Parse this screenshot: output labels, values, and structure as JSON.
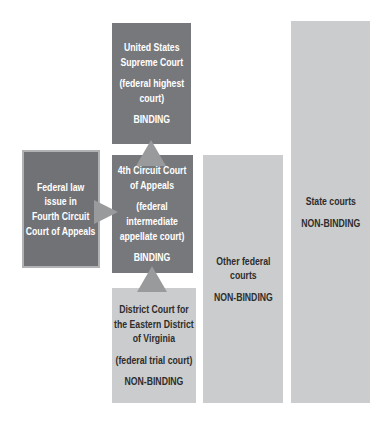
{
  "colors": {
    "dark_box": "#77787b",
    "left_box": "#717275",
    "left_box_border": "#b1b2b4",
    "light_box": "#cbcccd",
    "arrow": "#999a9c",
    "light_text": "#ffffff",
    "dark_text": "#2d2d2e",
    "page_bg": "#ffffff"
  },
  "diagram": {
    "supreme": {
      "name": "United States\nSupreme Court",
      "type": "(federal highest\ncourt)",
      "status": "BINDING"
    },
    "fourth_circuit": {
      "name": "4th Circuit Court\nof Appeals",
      "type": "(federal\nintermediate\nappellate court)",
      "status": "BINDING"
    },
    "district": {
      "name": "District Court for\nthe Eastern District\nof Virginia",
      "type": "(federal trial court)",
      "status": "NON-BINDING"
    },
    "issue": {
      "name": "Federal law\nissue in\nFourth Circuit\nCourt of Appeals"
    },
    "other_federal": {
      "name": "Other federal\ncourts",
      "status": "NON-BINDING"
    },
    "state": {
      "name": "State courts",
      "status": "NON-BINDING"
    }
  }
}
